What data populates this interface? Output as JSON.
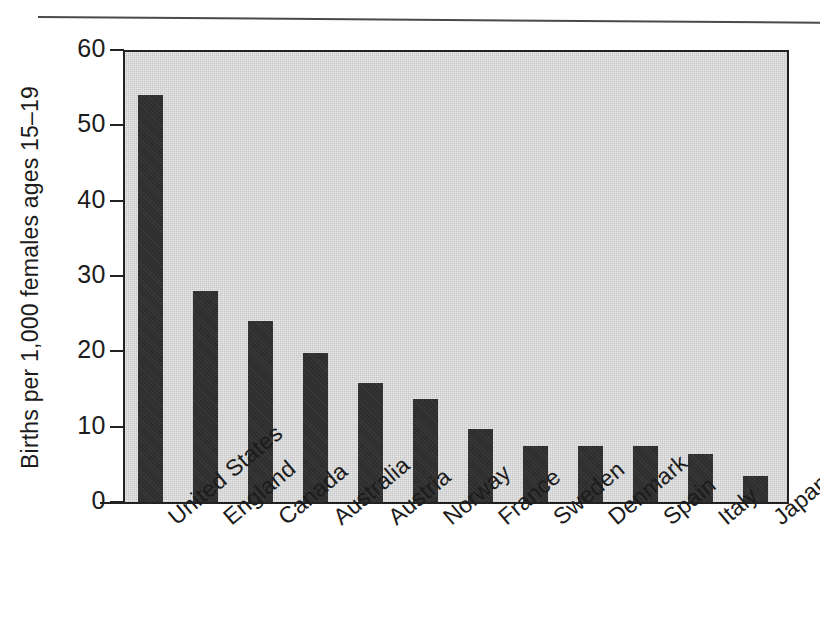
{
  "figure": {
    "background_color": "#ffffff",
    "plot_background_color": "#e9e9e9",
    "bar_color": "#2e2e2e",
    "axis_color": "#222222"
  },
  "chart_data": {
    "type": "bar",
    "title": "",
    "subtitle": "",
    "xlabel": "",
    "ylabel": "Births per 1,000 females ages 15–19",
    "ylim": [
      0,
      60
    ],
    "yticks": [
      0,
      10,
      20,
      30,
      40,
      50,
      60
    ],
    "ytick_labels": [
      "0",
      "10",
      "20",
      "30",
      "40",
      "50",
      "60"
    ],
    "grid": false,
    "legend": "none",
    "orientation": "vertical",
    "categories": [
      "United States",
      "England",
      "Canada",
      "Australia",
      "Austria",
      "Norway",
      "France",
      "Sweden",
      "Denmark",
      "Spain",
      "Italy",
      "Japan"
    ],
    "values": [
      54,
      28,
      24,
      19.8,
      15.8,
      13.7,
      9.7,
      7.5,
      7.5,
      7.4,
      6.4,
      3.4
    ],
    "series": [
      {
        "name": "Births per 1,000 females ages 15-19",
        "values": [
          54,
          28,
          24,
          19.8,
          15.8,
          13.7,
          9.7,
          7.5,
          7.5,
          7.4,
          6.4,
          3.4
        ]
      }
    ],
    "annotations": []
  }
}
